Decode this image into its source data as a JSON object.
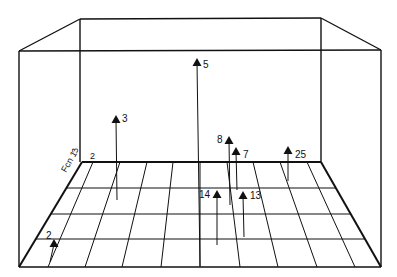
{
  "figure": {
    "type": "3d-perspective-scatter",
    "axis_labels": {
      "side_axis": "Fcn 1",
      "vertical_tick": "3",
      "back_tick": "2"
    },
    "points": [
      {
        "label": "2",
        "marker": [
          54,
          244
        ],
        "base": [
          50,
          262
        ]
      },
      {
        "label": "3",
        "marker": [
          116,
          120
        ],
        "base": [
          117,
          200
        ]
      },
      {
        "label": "5",
        "marker": [
          197,
          63
        ],
        "base": [
          200,
          266
        ]
      },
      {
        "label": "8",
        "marker": [
          229,
          141
        ],
        "base": [
          230,
          205
        ]
      },
      {
        "label": "7",
        "marker": [
          236,
          152
        ],
        "base": [
          237,
          190
        ]
      },
      {
        "label": "25",
        "marker": [
          288,
          151
        ],
        "base": [
          288,
          181
        ]
      },
      {
        "label": "14",
        "marker": [
          217,
          195
        ],
        "base": [
          217,
          245
        ]
      },
      {
        "label": "13",
        "marker": [
          243,
          196
        ],
        "base": [
          244,
          237
        ]
      }
    ],
    "colors": {
      "ink": "#111111",
      "background": "#ffffff"
    }
  }
}
